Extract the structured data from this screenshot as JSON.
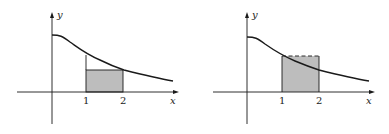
{
  "figures": [
    {
      "id": "left",
      "description": "Lower rectangle (inscribed) under decreasing curve on [1,2]",
      "axis_labels": {
        "x": "x",
        "y": "y"
      },
      "ticks": [
        "1",
        "2"
      ],
      "rectangle_style": "solid"
    },
    {
      "id": "right",
      "description": "Upper rectangle (circumscribed) over decreasing curve on [1,2]",
      "axis_labels": {
        "x": "x",
        "y": "y"
      },
      "ticks": [
        "1",
        "2"
      ],
      "rectangle_style": "dashed-top"
    }
  ],
  "colors": {
    "ink": "#1a1a1a",
    "fill": "#bdbdbd"
  }
}
